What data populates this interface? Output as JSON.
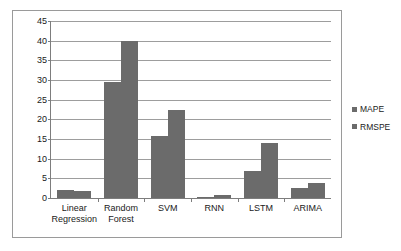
{
  "chart_data": {
    "type": "bar",
    "title": "",
    "xlabel": "",
    "ylabel": "",
    "ylim": [
      0,
      45
    ],
    "yticks": [
      0,
      5,
      10,
      15,
      20,
      25,
      30,
      35,
      40,
      45
    ],
    "grid": true,
    "legend_position": "right",
    "categories": [
      "Linear\nRegression",
      "Random\nForest",
      "SVM",
      "RNN",
      "LSTM",
      "ARIMA"
    ],
    "series": [
      {
        "name": "MAPE",
        "values": [
          2.0,
          29.5,
          15.7,
          0.3,
          6.8,
          2.6
        ]
      },
      {
        "name": "RMSPE",
        "values": [
          1.7,
          40.0,
          22.5,
          0.8,
          14.0,
          3.9
        ]
      }
    ],
    "colors": {
      "bar": "#6b6b6b",
      "gridline": "#9d9d9d",
      "axis": "#7d7d7d",
      "frame": "#9a9a9a",
      "text": "#1a1a1a",
      "background": "#ffffff"
    }
  },
  "legend": {
    "items": [
      {
        "label": "MAPE"
      },
      {
        "label": "RMSPE"
      }
    ]
  }
}
